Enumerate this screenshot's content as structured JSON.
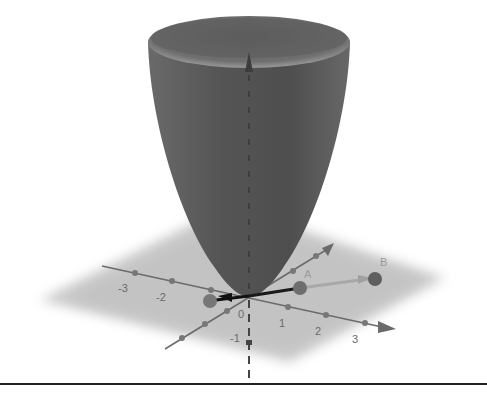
{
  "graphics_view": {
    "type": "3D graphics view",
    "surface": {
      "name": "paraboloid",
      "color": "#555555",
      "rim_color": "#7a7a7a"
    },
    "plane_color": "#c8c8c8",
    "axis_color": "#6b6b6b",
    "x_axis": {
      "tick_labels": [
        "-3",
        "-2",
        "0",
        "1",
        "2",
        "3"
      ]
    },
    "y_axis": {
      "tick_labels": [
        "-1"
      ]
    },
    "z_axis": {
      "style": "dashed"
    },
    "points": [
      {
        "label": "A",
        "color": "#6e6e6e"
      },
      {
        "label": "B",
        "color": "#5e5e5e"
      }
    ],
    "vectors": [
      {
        "from": "origin",
        "to": "A",
        "color": "#1a1a1a"
      },
      {
        "from": "A",
        "to": "B",
        "color": "#a8a8a8"
      },
      {
        "from": "origin",
        "to": "left point",
        "color": "#111111"
      }
    ]
  },
  "labels": {
    "x_m3": "-3",
    "x_m2": "-2",
    "origin": "0",
    "x_1": "1",
    "x_2": "2",
    "x_3": "3",
    "y_m1": "-1",
    "point_a": "A",
    "point_b": "B"
  }
}
